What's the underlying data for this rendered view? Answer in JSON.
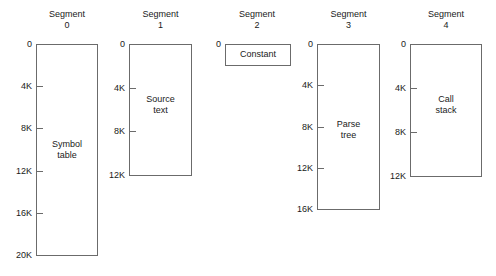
{
  "diagram": {
    "title_prefix": "Segment",
    "segments": [
      {
        "index": "0",
        "title_word": "Segment",
        "title_number": "0",
        "content_line1": "Symbol",
        "content_line2": "table",
        "ticks": [
          "0",
          "4K",
          "8K",
          "12K",
          "16K",
          "20K"
        ],
        "max_address": "20K",
        "box": {
          "left": 36,
          "top": 44,
          "width": 62,
          "height": 212
        },
        "title": {
          "left": 36,
          "top": 9,
          "width": 62
        },
        "content": {
          "left": 36,
          "top": 139,
          "width": 62
        }
      },
      {
        "index": "1",
        "title_word": "Segment",
        "title_number": "1",
        "content_line1": "Source",
        "content_line2": "text",
        "ticks": [
          "0",
          "4K",
          "8K",
          "12K"
        ],
        "max_address": "12K",
        "box": {
          "left": 129,
          "top": 44,
          "width": 63,
          "height": 132
        },
        "title": {
          "left": 129,
          "top": 9,
          "width": 63
        },
        "content": {
          "left": 129,
          "top": 94,
          "width": 63
        }
      },
      {
        "index": "2",
        "title_word": "Segment",
        "title_number": "2",
        "content_line1": "Constant",
        "content_line2": "",
        "ticks": [
          "0"
        ],
        "max_address": "0",
        "box": {
          "left": 225,
          "top": 44,
          "width": 66,
          "height": 22
        },
        "title": {
          "left": 222,
          "top": 9,
          "width": 70
        },
        "content": {
          "left": 225,
          "top": 49,
          "width": 66
        }
      },
      {
        "index": "3",
        "title_word": "Segment",
        "title_number": "3",
        "content_line1": "Parse",
        "content_line2": "tree",
        "ticks": [
          "0",
          "4K",
          "8K",
          "12K",
          "16K"
        ],
        "max_address": "16K",
        "box": {
          "left": 317,
          "top": 44,
          "width": 63,
          "height": 166
        },
        "title": {
          "left": 317,
          "top": 9,
          "width": 63
        },
        "content": {
          "left": 317,
          "top": 119,
          "width": 63
        }
      },
      {
        "index": "4",
        "title_word": "Segment",
        "title_number": "4",
        "content_line1": "Call",
        "content_line2": "stack",
        "ticks": [
          "0",
          "4K",
          "8K",
          "12K"
        ],
        "max_address": "12K",
        "box": {
          "left": 410,
          "top": 44,
          "width": 72,
          "height": 133
        },
        "title": {
          "left": 410,
          "top": 9,
          "width": 72
        },
        "content": {
          "left": 410,
          "top": 94,
          "width": 72
        }
      }
    ],
    "tick_spacing_px": 44,
    "colors": {
      "background": "#ffffff",
      "line": "#6b6b6b",
      "text": "#1a1a1a"
    }
  }
}
